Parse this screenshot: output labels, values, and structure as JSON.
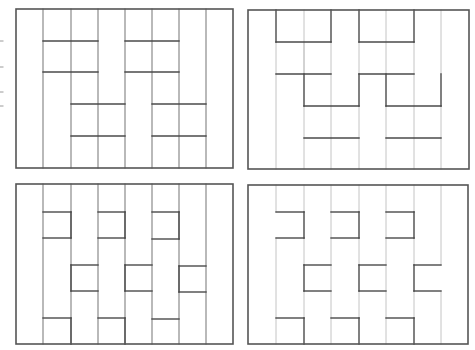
{
  "figure": {
    "colors": {
      "frame": "#555555",
      "wall": "#4a4a4a",
      "grid_medium": "#8a8a8a",
      "grid_light": "#c4c4c4",
      "tick": "#9a9a9a"
    },
    "left_ticks_y": [
      41,
      67,
      92,
      106
    ],
    "panels": [
      {
        "id": "top-left",
        "frame": {
          "x": 16,
          "y": 9,
          "w": 217,
          "h": 159
        },
        "columns_x": [
          43,
          71,
          98,
          125,
          152,
          179,
          206
        ],
        "grid_style": "medium",
        "walls": [
          [
            43,
            41,
            98,
            41
          ],
          [
            125,
            41,
            179,
            41
          ],
          [
            43,
            72,
            98,
            72
          ],
          [
            125,
            72,
            179,
            72
          ],
          [
            71,
            104,
            125,
            104
          ],
          [
            152,
            104,
            206,
            104
          ],
          [
            71,
            136,
            125,
            136
          ],
          [
            152,
            136,
            206,
            136
          ]
        ],
        "light_lines": []
      },
      {
        "id": "top-right",
        "frame": {
          "x": 248,
          "y": 10,
          "w": 221,
          "h": 159
        },
        "columns_x": [],
        "grid_style": "light",
        "walls": [
          [
            276,
            42,
            331,
            42
          ],
          [
            359,
            42,
            414,
            42
          ],
          [
            276,
            74,
            331,
            74
          ],
          [
            359,
            74,
            414,
            74
          ],
          [
            304,
            106,
            359,
            106
          ],
          [
            386,
            106,
            441,
            106
          ],
          [
            304,
            138,
            359,
            138
          ],
          [
            386,
            138,
            441,
            138
          ],
          [
            276,
            10,
            276,
            42
          ],
          [
            331,
            10,
            331,
            42
          ],
          [
            359,
            10,
            359,
            42
          ],
          [
            414,
            10,
            414,
            42
          ],
          [
            304,
            74,
            304,
            106
          ],
          [
            359,
            74,
            359,
            106
          ],
          [
            386,
            74,
            386,
            106
          ],
          [
            441,
            74,
            441,
            106
          ]
        ],
        "light_lines": [
          [
            304,
            10,
            304,
            74
          ],
          [
            386,
            10,
            386,
            74
          ],
          [
            441,
            10,
            441,
            74
          ],
          [
            276,
            74,
            276,
            169
          ],
          [
            331,
            74,
            331,
            106
          ],
          [
            414,
            74,
            414,
            106
          ],
          [
            331,
            106,
            331,
            138
          ],
          [
            414,
            106,
            414,
            138
          ],
          [
            304,
            138,
            304,
            169
          ],
          [
            331,
            138,
            331,
            169
          ],
          [
            359,
            138,
            359,
            169
          ],
          [
            386,
            138,
            386,
            169
          ],
          [
            414,
            138,
            414,
            169
          ],
          [
            441,
            138,
            441,
            169
          ],
          [
            304,
            106,
            304,
            138
          ],
          [
            359,
            106,
            359,
            138
          ],
          [
            386,
            106,
            386,
            138
          ],
          [
            441,
            106,
            441,
            138
          ],
          [
            276,
            42,
            276,
            74
          ],
          [
            331,
            42,
            331,
            74
          ],
          [
            359,
            42,
            359,
            74
          ],
          [
            414,
            42,
            414,
            74
          ],
          [
            304,
            42,
            304,
            74
          ]
        ]
      },
      {
        "id": "bottom-left",
        "frame": {
          "x": 16,
          "y": 184,
          "w": 217,
          "h": 160
        },
        "columns_x": [
          43,
          71,
          98,
          125,
          152,
          179,
          206
        ],
        "grid_style": "medium",
        "walls": [
          [
            43,
            212,
            71,
            212
          ],
          [
            43,
            238,
            71,
            238
          ],
          [
            43,
            318,
            71,
            318
          ],
          [
            71,
            265,
            98,
            265
          ],
          [
            71,
            291,
            98,
            291
          ],
          [
            98,
            212,
            125,
            212
          ],
          [
            98,
            238,
            125,
            238
          ],
          [
            98,
            318,
            125,
            318
          ],
          [
            125,
            265,
            152,
            265
          ],
          [
            125,
            291,
            152,
            291
          ],
          [
            152,
            212,
            179,
            212
          ],
          [
            152,
            239,
            179,
            239
          ],
          [
            152,
            319,
            179,
            319
          ],
          [
            179,
            266,
            206,
            266
          ],
          [
            179,
            292,
            206,
            292
          ],
          [
            71,
            212,
            71,
            238
          ],
          [
            125,
            212,
            125,
            238
          ],
          [
            179,
            212,
            179,
            239
          ],
          [
            71,
            265,
            71,
            291
          ],
          [
            125,
            265,
            125,
            291
          ],
          [
            179,
            266,
            179,
            292
          ],
          [
            71,
            318,
            71,
            344
          ],
          [
            125,
            318,
            125,
            344
          ]
        ],
        "light_lines": []
      },
      {
        "id": "bottom-right",
        "frame": {
          "x": 248,
          "y": 185,
          "w": 220,
          "h": 159
        },
        "columns_x": [],
        "grid_style": "light",
        "walls": [
          [
            276,
            212,
            304,
            212
          ],
          [
            304,
            212,
            304,
            238
          ],
          [
            276,
            238,
            304,
            238
          ],
          [
            331,
            212,
            359,
            212
          ],
          [
            359,
            212,
            359,
            238
          ],
          [
            331,
            238,
            359,
            238
          ],
          [
            386,
            212,
            414,
            212
          ],
          [
            414,
            212,
            414,
            238
          ],
          [
            386,
            238,
            414,
            238
          ],
          [
            304,
            265,
            331,
            265
          ],
          [
            304,
            265,
            304,
            291
          ],
          [
            304,
            291,
            331,
            291
          ],
          [
            359,
            265,
            386,
            265
          ],
          [
            359,
            265,
            359,
            291
          ],
          [
            359,
            291,
            386,
            291
          ],
          [
            414,
            265,
            441,
            265
          ],
          [
            414,
            265,
            414,
            291
          ],
          [
            414,
            291,
            441,
            291
          ],
          [
            276,
            318,
            304,
            318
          ],
          [
            304,
            318,
            304,
            344
          ],
          [
            331,
            318,
            359,
            318
          ],
          [
            359,
            318,
            359,
            344
          ],
          [
            386,
            318,
            414,
            318
          ],
          [
            414,
            318,
            414,
            344
          ]
        ],
        "light_lines": [
          [
            276,
            185,
            276,
            212
          ],
          [
            304,
            185,
            304,
            212
          ],
          [
            331,
            185,
            331,
            212
          ],
          [
            359,
            185,
            359,
            212
          ],
          [
            386,
            185,
            386,
            212
          ],
          [
            414,
            185,
            414,
            212
          ],
          [
            441,
            185,
            441,
            265
          ],
          [
            276,
            238,
            276,
            318
          ],
          [
            304,
            238,
            304,
            265
          ],
          [
            331,
            212,
            331,
            318
          ],
          [
            359,
            238,
            359,
            265
          ],
          [
            386,
            212,
            386,
            318
          ],
          [
            414,
            238,
            414,
            265
          ],
          [
            304,
            291,
            304,
            318
          ],
          [
            359,
            291,
            359,
            318
          ],
          [
            414,
            291,
            414,
            318
          ],
          [
            441,
            291,
            441,
            344
          ],
          [
            331,
            318,
            331,
            344
          ],
          [
            386,
            318,
            386,
            344
          ],
          [
            276,
            318,
            276,
            344
          ]
        ]
      }
    ]
  }
}
